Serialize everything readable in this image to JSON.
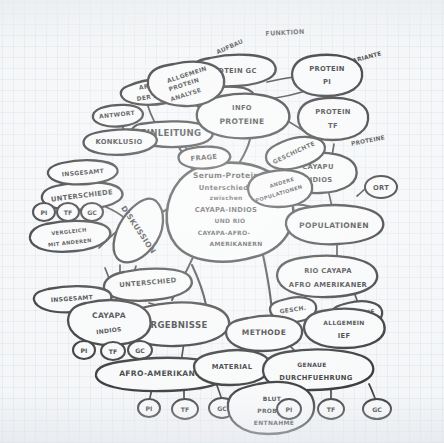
{
  "page": {
    "kind": "hand-drawn-mindmap-photo",
    "medium": "graph paper, black pen",
    "language": "German",
    "background_color": "#f3f5f7",
    "ink_color": "#17171a"
  },
  "center": {
    "label": "Serum-Protein\nUnterschiede\nzwischen\nCAYAPA-INDIOS\nUND RIO\nCAYAPA-AFRO-\nAMERIKANERN",
    "lines": [
      "Serum-Protein",
      "Unterschiede",
      "zwischen",
      "CAYAPA-INDIOS",
      "UND RIO",
      "CAYAPA-AFRO-",
      "AMERIKANERN"
    ]
  },
  "branches": [
    {
      "id": "einleitung",
      "label": "EINLEITUNG",
      "children": [
        {
          "label": "ART DER ARBEIT"
        },
        {
          "label": "PROBLEM"
        },
        {
          "label": "FRAGE"
        },
        {
          "label": "KONKLUSIO"
        },
        {
          "label": "ANTWORT"
        }
      ]
    },
    {
      "id": "info-proteine",
      "label": "INFO PROTEINE",
      "children": [
        {
          "label": "ALLGEMEIN PROTEIN ANALYSE"
        },
        {
          "label": "PROTEIN GC"
        },
        {
          "label": "AUFBAU"
        },
        {
          "label": "FUNKTION"
        },
        {
          "label": "VARIANTE"
        },
        {
          "label": "PROTEIN PI"
        },
        {
          "label": "PROTEIN TF"
        }
      ]
    },
    {
      "id": "populationen",
      "label": "POPULATIONEN",
      "children": [
        {
          "label": "CAYAPU INDIOS"
        },
        {
          "label": "GESCHICHTE"
        },
        {
          "label": "PROTEINE"
        },
        {
          "label": "ANDERE POPULATIONEN"
        },
        {
          "label": "ORT"
        },
        {
          "label": "RIO CAYAPA AFRO AMERIKANER"
        },
        {
          "label": "GESCH."
        },
        {
          "label": "PROTEINE"
        }
      ]
    },
    {
      "id": "diskussion",
      "label": "DISKUSSION",
      "children": [
        {
          "label": "UNTERSCHIEDE"
        },
        {
          "label": "INSGESAMT"
        },
        {
          "label": "VERGLEICH MIT ANDEREN"
        },
        {
          "label": "PI"
        },
        {
          "label": "TF"
        },
        {
          "label": "GC"
        }
      ]
    },
    {
      "id": "ergebnisse",
      "label": "ERGEBNISSE",
      "children": [
        {
          "label": "UNTERSCHIED"
        },
        {
          "label": "INSGESAMT"
        },
        {
          "label": "CAYAPA INDIOS"
        },
        {
          "label": "AFRO-AMERIKANER"
        },
        {
          "label": "PI"
        },
        {
          "label": "TF"
        },
        {
          "label": "GC"
        }
      ]
    },
    {
      "id": "methode",
      "label": "METHODE",
      "children": [
        {
          "label": "ALLGEMEIN IEF"
        },
        {
          "label": "MATERIAL"
        },
        {
          "label": "GENAUE DURCHFUEHRUNG"
        },
        {
          "label": "BLUT PROBEN ENTNAHME"
        },
        {
          "label": "PI"
        },
        {
          "label": "TF"
        },
        {
          "label": "GC"
        }
      ]
    }
  ],
  "nodes": {
    "art_der_arbeit_l1": "ART",
    "art_der_arbeit_l2": "DER ARBEIT",
    "einleitung": "EINLEITUNG",
    "problem": "PROBLEM",
    "frage": "FRAGE",
    "konklusio": "KONKLUSIO",
    "antwort": "ANTWORT",
    "aufbau": "AUFBAU",
    "funktion": "FUNKTION",
    "protein_gc": "PROTEIN GC",
    "variante": "VARIANTE",
    "allg_prot_l1": "ALLGEMEIN",
    "allg_prot_l2": "PROTEIN",
    "allg_prot_l3": "ANALYSE",
    "info_prot_l1": "INFO",
    "info_prot_l2": "PROTEINE",
    "protein_pi_l1": "PROTEIN",
    "protein_pi_l2": "PI",
    "protein_tf_l1": "PROTEIN",
    "protein_tf_l2": "TF",
    "geschichte": "GESCHICHTE",
    "proteine_top": "PROTEINE",
    "cayapu_l1": "CAYAPU",
    "cayapu_l2": "INDIOS",
    "andere_pop_l1": "ANDERE",
    "andere_pop_l2": "POPULATIONEN",
    "ort": "ORT",
    "populationen": "POPULATIONEN",
    "rio_l1": "RIO CAYAPA",
    "rio_l2": "AFRO AMERIKANER",
    "gesch": "GESCH.",
    "proteine_rio": "PROTEINE",
    "methode": "METHODE",
    "allgemein_ief_l1": "ALLGEMEIN",
    "allgemein_ief_l2": "IEF",
    "material": "MATERIAL",
    "genaue_l1": "GENAUE",
    "genaue_l2": "DURCHFUEHRUNG",
    "blut_l1": "BLUT",
    "blut_l2": "PROBEN",
    "blut_l3": "ENTNAHME",
    "insgesamt_top": "INSGESAMT",
    "unterschiede_top": "UNTERSCHIEDE",
    "diskussion": "DISKUSSION",
    "vergleich_l1": "VERGLEICH",
    "vergleich_l2": "MIT ANDEREN",
    "unterschied_mid": "UNTERSCHIED",
    "insgesamt_mid": "INSGESAMT",
    "cayapa_l1": "CAYAPA",
    "cayapa_l2": "INDIOS",
    "ergebnisse": "ERGEBNISSE",
    "afro": "AFRO-AMERIKANER",
    "pi": "PI",
    "tf": "TF",
    "gc": "GC"
  }
}
